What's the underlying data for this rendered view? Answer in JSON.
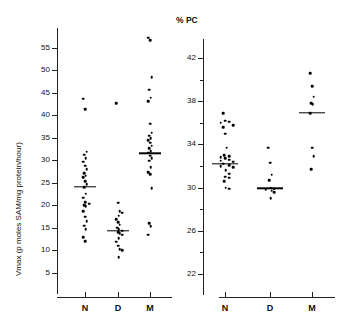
{
  "figure": {
    "background": "#ffffff",
    "ink": "#000000",
    "width": 339,
    "height": 326
  },
  "panels": {
    "left": {
      "name": "vmax-panel",
      "title": "",
      "ylabel": "Vmax (p moles SAM/mg protein/hour)",
      "ytick_labels": [
        "5",
        "10",
        "15",
        "20",
        "25",
        "30",
        "35",
        "40",
        "45",
        "50",
        "55"
      ],
      "xtick_labels": [
        "N",
        "D",
        "M"
      ]
    },
    "right": {
      "name": "pc-panel",
      "title": "% PC",
      "ylabel": "",
      "ytick_labels": [
        "22",
        "26",
        "30",
        "34",
        "38",
        "42"
      ],
      "xtick_labels": [
        "N",
        "D",
        "M"
      ]
    }
  },
  "chart_data": [
    {
      "type": "scatter",
      "name": "vmax-dotplot",
      "title": "",
      "xlabel": "",
      "ylabel": "Vmax (p moles SAM/mg protein/hour)",
      "ylim": [
        2,
        58
      ],
      "yticks": [
        5,
        10,
        15,
        20,
        25,
        30,
        35,
        40,
        45,
        50,
        55
      ],
      "grid": false,
      "legend": "none",
      "categories": [
        "N",
        "D",
        "M"
      ],
      "series": [
        {
          "name": "N",
          "values": [
            43.6,
            41.3,
            31.8,
            31.2,
            30.4,
            29.6,
            28.7,
            27.9,
            27.1,
            26.5,
            26.2,
            25.3,
            24.6,
            23.9,
            22.5,
            21.6,
            20.6,
            20.3,
            20.0,
            19.7,
            18.6,
            17.4,
            16.4,
            15.4,
            14.6,
            12.9,
            11.9
          ],
          "mean": 24.1
        },
        {
          "name": "D",
          "values": [
            42.6,
            20.5,
            18.6,
            18.3,
            17.6,
            16.9,
            16.2,
            15.6,
            15.0,
            14.6,
            14.3,
            14.0,
            13.7,
            13.4,
            12.6,
            11.8,
            11.0,
            10.2,
            9.9,
            8.4
          ],
          "mean": 14.2
        },
        {
          "name": "M",
          "values": [
            57.2,
            56.6,
            48.4,
            45.6,
            43.8,
            43.1,
            38.1,
            36.1,
            35.4,
            34.9,
            34.4,
            33.8,
            33.2,
            32.6,
            32.0,
            31.6,
            31.0,
            30.4,
            29.8,
            28.4,
            27.3,
            26.9,
            23.7,
            15.9,
            15.3,
            13.4
          ],
          "mean": 31.5
        }
      ]
    },
    {
      "type": "scatter",
      "name": "pc-dotplot",
      "title": "% PC",
      "xlabel": "",
      "ylabel": "",
      "ylim": [
        20.8,
        43.2
      ],
      "yticks": [
        22,
        24,
        26,
        28,
        30,
        32,
        34,
        36,
        38,
        40,
        42
      ],
      "ytick_labeled": [
        22,
        26,
        30,
        34,
        38,
        42
      ],
      "grid": false,
      "legend": "none",
      "categories": [
        "N",
        "D",
        "M"
      ],
      "series": [
        {
          "name": "N",
          "values": [
            36.9,
            36.2,
            36.1,
            36.0,
            35.8,
            35.6,
            35.0,
            33.7,
            33.0,
            32.9,
            32.8,
            32.7,
            32.6,
            32.5,
            32.4,
            32.2,
            32.1,
            32.0,
            31.9,
            31.6,
            31.3,
            31.0,
            30.9,
            30.6,
            30.0,
            29.9
          ],
          "mean": 32.2
        },
        {
          "name": "D",
          "values": [
            33.7,
            32.3,
            31.2,
            30.7,
            30.0,
            29.9,
            29.8,
            29.7,
            29.6,
            29.0
          ],
          "mean": 29.95
        },
        {
          "name": "M",
          "values": [
            40.6,
            39.4,
            38.4,
            37.8,
            37.7,
            36.9,
            33.7,
            32.9,
            31.7
          ],
          "mean": 36.9
        }
      ]
    }
  ]
}
